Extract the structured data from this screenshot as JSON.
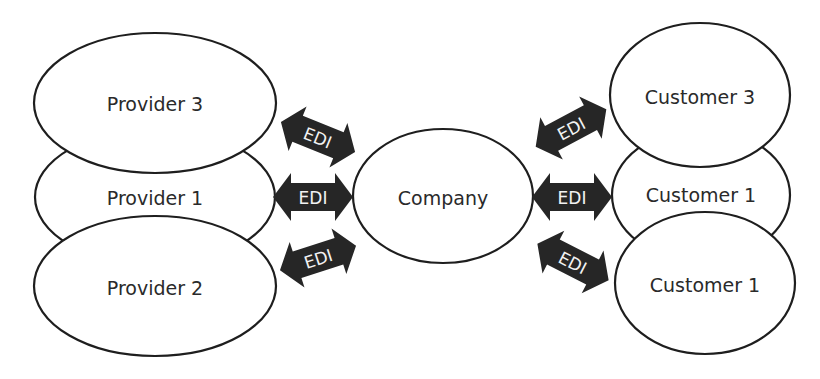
{
  "diagram": {
    "type": "edi-network",
    "center": {
      "id": "company",
      "label": "Company"
    },
    "providers": [
      {
        "id": "provider-3",
        "label": "Provider 3"
      },
      {
        "id": "provider-1",
        "label": "Provider 1"
      },
      {
        "id": "provider-2",
        "label": "Provider 2"
      }
    ],
    "customers": [
      {
        "id": "customer-3",
        "label": "Customer 3"
      },
      {
        "id": "customer-1",
        "label": "Customer 1"
      },
      {
        "id": "customer-2",
        "label": "Customer 2"
      }
    ],
    "connections": [
      {
        "from": "provider-3",
        "to": "company",
        "label": "EDI",
        "direction": "bidirectional"
      },
      {
        "from": "provider-1",
        "to": "company",
        "label": "EDI",
        "direction": "bidirectional"
      },
      {
        "from": "provider-2",
        "to": "company",
        "label": "EDI",
        "direction": "bidirectional"
      },
      {
        "from": "company",
        "to": "customer-3",
        "label": "EDI",
        "direction": "bidirectional"
      },
      {
        "from": "company",
        "to": "customer-1",
        "label": "EDI",
        "direction": "bidirectional"
      },
      {
        "from": "company",
        "to": "customer-2",
        "label": "EDI",
        "direction": "bidirectional"
      }
    ],
    "colors": {
      "arrow_fill": "#262626",
      "arrow_text": "#f2f2f2",
      "node_stroke": "#1e1e1e",
      "node_fill": "#ffffff"
    }
  }
}
